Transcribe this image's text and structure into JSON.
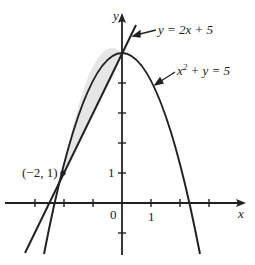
{
  "diagram": {
    "type": "graph",
    "axes": {
      "x_label": "x",
      "y_label": "y",
      "origin_label": "0",
      "x_tick_label": "1",
      "y_tick_label": "1",
      "x_range": [
        -4,
        4
      ],
      "y_range": [
        -2,
        6
      ]
    },
    "curves": [
      {
        "name": "line",
        "equation": "y = 2x + 5",
        "label": "y = 2x + 5"
      },
      {
        "name": "parabola",
        "equation": "x² + y = 5",
        "label_pre": "x",
        "label_sup": "2",
        "label_post": " + y = 5"
      }
    ],
    "intersection_points": [
      {
        "label": "(−2, 1)",
        "x": -2,
        "y": 1
      },
      {
        "label": "",
        "x": 0,
        "y": 5
      }
    ],
    "shaded_region": "between parabola and line from x = -2 to x = 0",
    "colors": {
      "stroke": "#222222",
      "shade": "#e6e6e6",
      "background": "#ffffff"
    }
  }
}
